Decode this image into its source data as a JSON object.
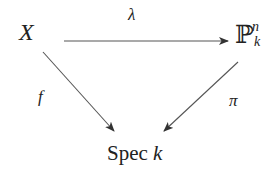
{
  "diagram": {
    "type": "commutative-triangle",
    "nodes": {
      "top_left": {
        "label": "X"
      },
      "top_right": {
        "label": "ℙ",
        "superscript": "n",
        "subscript": "k"
      },
      "bottom": {
        "label_roman": "Spec",
        "label_italic": "k"
      }
    },
    "arrows": [
      {
        "from": "top_left",
        "to": "top_right",
        "label": "λ"
      },
      {
        "from": "top_left",
        "to": "bottom",
        "label": "f"
      },
      {
        "from": "top_right",
        "to": "bottom",
        "label": "π"
      }
    ],
    "colors": {
      "line": "#444444",
      "text": "#222222",
      "background": "#ffffff"
    }
  }
}
